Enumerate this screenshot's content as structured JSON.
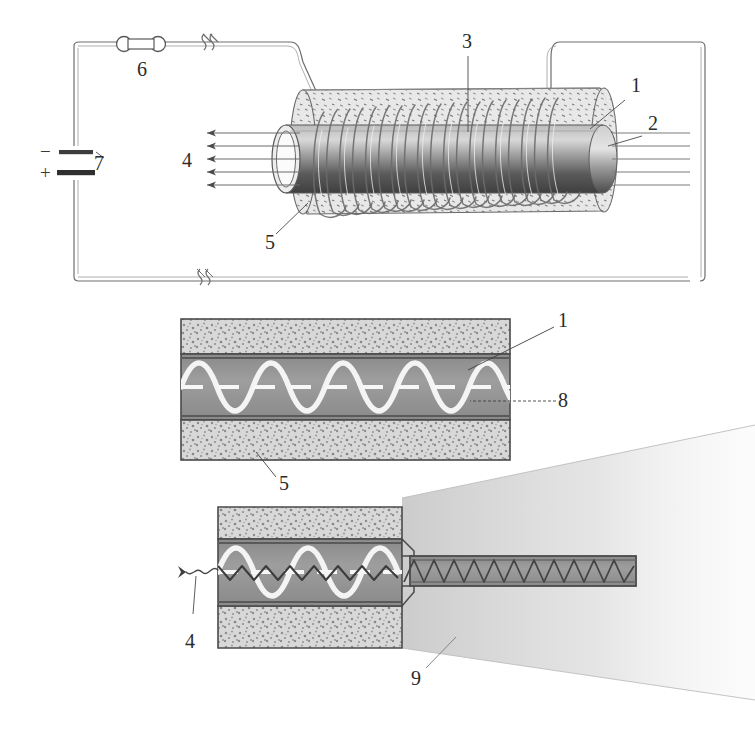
{
  "figure": {
    "background_color": "#ffffff",
    "ink_color": "#3a3a3a",
    "line_color": "#555555"
  },
  "reference_numerals": [
    {
      "id": "1",
      "label": "1",
      "x": 631,
      "y": 85,
      "meaning": "inner tube wall / channel boundary"
    },
    {
      "id": "2",
      "label": "2",
      "x": 648,
      "y": 123,
      "meaning": "outer cylinder end face"
    },
    {
      "id": "3",
      "label": "3",
      "x": 466,
      "y": 40,
      "meaning": "solenoid coil winding"
    },
    {
      "id": "4",
      "label": "4",
      "x": 186,
      "y": 160,
      "meaning": "emitted radiation arrows"
    },
    {
      "id": "5",
      "label": "5",
      "x": 269,
      "y": 240,
      "meaning": "outer jacket / cladding material"
    },
    {
      "id": "6",
      "label": "6",
      "x": 141,
      "y": 68,
      "meaning": "switch"
    },
    {
      "id": "7",
      "label": "7",
      "x": 96,
      "y": 165,
      "meaning": "battery / DC source"
    },
    {
      "id": "1b",
      "label": "1",
      "x": 563,
      "y": 320,
      "meaning": "inner tube wall (cross-section)"
    },
    {
      "id": "8",
      "label": "8",
      "x": 563,
      "y": 396,
      "meaning": "guided wave axis"
    },
    {
      "id": "5b",
      "label": "5",
      "x": 283,
      "y": 482,
      "meaning": "outer jacket (cross-section)"
    },
    {
      "id": "4b",
      "label": "4",
      "x": 190,
      "y": 641,
      "meaning": "emitted radiation"
    },
    {
      "id": "9",
      "label": "9",
      "x": 415,
      "y": 678,
      "meaning": "expanding output beam"
    }
  ],
  "circuit": {
    "battery": {
      "name": "battery",
      "minus_label": "−",
      "plus_label": "+",
      "numeral": "7"
    },
    "switch": {
      "name": "switch",
      "numeral": "6"
    },
    "break_marks": 3
  },
  "panels": {
    "top": {
      "name": "perspective-view",
      "description": "Solenoid coil wound on an inner cylindrical tube inside a speckled outer jacket; five arrows emerge to the left.",
      "arrow_count": 5
    },
    "middle": {
      "name": "longitudinal-section-uniform",
      "description": "Longitudinal cross-section of the uniform waveguide showing a sinusoidal wave and dashed axis.",
      "wave_cycles": 4
    },
    "bottom": {
      "name": "longitudinal-section-tapered",
      "description": "Longitudinal cross-section with a tapered constriction; wave compresses into a narrow channel and a beam expands outward.",
      "wave_cycles": 3,
      "zigzag_cycles": 12
    }
  },
  "colors": {
    "speckle_fill": "#d2d2d2",
    "channel_dark": "#8e8e8e",
    "channel_mid": "#a6a6a6",
    "wave_white": "#f7f7f7",
    "outline": "#4a4a4a",
    "beam_gray": "#dcdcdc",
    "cylinder_dark": "#4f4f4f"
  }
}
